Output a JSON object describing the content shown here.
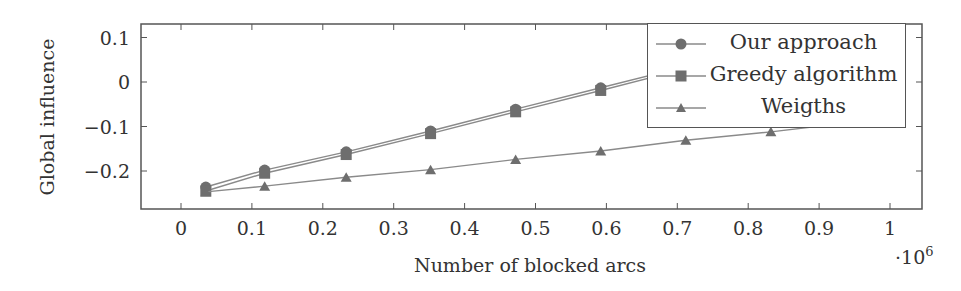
{
  "chart_data": {
    "type": "line",
    "title": "",
    "xlabel": "Number of blocked arcs",
    "ylabel": "Global influence",
    "x_scale_label": "·10^6",
    "x_scale_base": "·10",
    "x_scale_exp": "6",
    "xlim": [
      -0.056,
      1.045
    ],
    "ylim": [
      -0.285,
      0.13
    ],
    "x_ticks": [
      0,
      0.1,
      0.2,
      0.3,
      0.4,
      0.5,
      0.6,
      0.7,
      0.8,
      0.9,
      1
    ],
    "x_tick_labels": [
      "0",
      "0.1",
      "0.2",
      "0.3",
      "0.4",
      "0.5",
      "0.6",
      "0.7",
      "0.8",
      "0.9",
      "1"
    ],
    "y_ticks": [
      0.1,
      0,
      -0.1,
      -0.2
    ],
    "y_tick_labels": [
      "0.1",
      "0",
      "−0.1",
      "−0.2"
    ],
    "grid": false,
    "legend_position": "north east",
    "series": [
      {
        "name": "Our approach",
        "marker": "circle",
        "x": [
          0.035,
          0.118,
          0.233,
          0.352,
          0.472,
          0.592,
          0.712
        ],
        "y": [
          -0.236,
          -0.198,
          -0.157,
          -0.11,
          -0.061,
          -0.013,
          0.035
        ]
      },
      {
        "name": "Greedy algorithm",
        "marker": "square",
        "x": [
          0.035,
          0.118,
          0.233,
          0.352,
          0.472,
          0.592,
          0.712
        ],
        "y": [
          -0.245,
          -0.205,
          -0.163,
          -0.116,
          -0.067,
          -0.019,
          0.03
        ]
      },
      {
        "name": "Weigths",
        "marker": "triangle",
        "x": [
          0.035,
          0.118,
          0.233,
          0.352,
          0.472,
          0.592,
          0.712,
          0.832,
          0.95
        ],
        "y": [
          -0.247,
          -0.234,
          -0.214,
          -0.197,
          -0.174,
          -0.155,
          -0.131,
          -0.112,
          -0.09
        ]
      }
    ]
  },
  "legend": {
    "items": [
      {
        "label": "Our approach"
      },
      {
        "label": "Greedy algorithm"
      },
      {
        "label": "Weigths"
      }
    ]
  },
  "colors": {
    "line": "#8a8a8a",
    "marker": "#6e6e6e",
    "axis": "#555555",
    "text": "#333333"
  }
}
